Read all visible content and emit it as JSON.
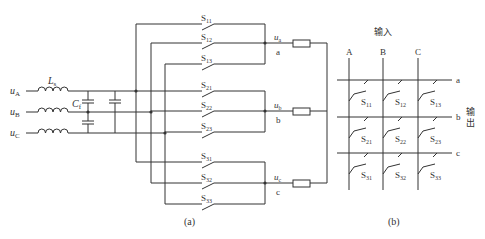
{
  "figure": {
    "panel_a_caption": "(a)",
    "panel_b_caption": "(b)",
    "inputs": [
      {
        "label": "u",
        "sub": "A"
      },
      {
        "label": "u",
        "sub": "B"
      },
      {
        "label": "u",
        "sub": "C"
      }
    ],
    "inductor": {
      "label": "L",
      "sub": "s"
    },
    "capacitor": {
      "label": "C",
      "sub": "f"
    },
    "switches": [
      {
        "label": "S",
        "sub": "11"
      },
      {
        "label": "S",
        "sub": "12"
      },
      {
        "label": "S",
        "sub": "13"
      },
      {
        "label": "S",
        "sub": "21"
      },
      {
        "label": "S",
        "sub": "22"
      },
      {
        "label": "S",
        "sub": "23"
      },
      {
        "label": "S",
        "sub": "31"
      },
      {
        "label": "S",
        "sub": "32"
      },
      {
        "label": "S",
        "sub": "33"
      }
    ],
    "outputs": [
      {
        "label": "u",
        "sub": "a",
        "node": "a"
      },
      {
        "label": "u",
        "sub": "b",
        "node": "b"
      },
      {
        "label": "u",
        "sub": "c",
        "node": "c"
      }
    ],
    "matrix": {
      "input_title": "输入",
      "output_title_line1": "输",
      "output_title_line2": "出",
      "columns": [
        "A",
        "B",
        "C"
      ],
      "rows": [
        "a",
        "b",
        "c"
      ]
    }
  }
}
